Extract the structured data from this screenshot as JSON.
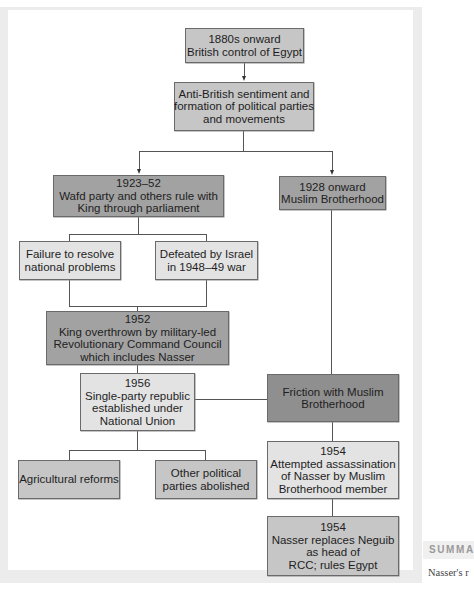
{
  "flowchart": {
    "nodes": {
      "british_control": {
        "lines": [
          "1880s onward",
          "British control of Egypt"
        ]
      },
      "anti_british": {
        "lines": [
          "Anti-British sentiment and",
          "formation of political parties",
          "and movements"
        ]
      },
      "wafd_rule": {
        "lines": [
          "1923–52",
          "Wafd party and others rule with",
          "King through parliament"
        ]
      },
      "muslim_brotherhood": {
        "lines": [
          "1928 onward",
          "Muslim Brotherhood"
        ]
      },
      "failure_problems": {
        "lines": [
          "Failure to resolve",
          "national problems"
        ]
      },
      "defeated_israel": {
        "lines": [
          "Defeated by Israel",
          "in 1948–49 war"
        ]
      },
      "king_overthrown": {
        "lines": [
          "1952",
          "King overthrown by military-led",
          "Revolutionary Command Council",
          "which includes Nasser"
        ]
      },
      "single_party": {
        "lines": [
          "1956",
          "Single-party republic",
          "established under",
          "National Union"
        ]
      },
      "friction": {
        "lines": [
          "Friction with Muslim",
          "Brotherhood"
        ]
      },
      "agricultural": {
        "lines": [
          "Agricultural reforms"
        ]
      },
      "parties_abolished": {
        "lines": [
          "Other political",
          "parties abolished"
        ]
      },
      "assassination": {
        "lines": [
          "1954",
          "Attempted assassination",
          "of Nasser by Muslim",
          "Brotherhood member"
        ]
      },
      "nasser_replaces": {
        "lines": [
          "1954",
          "Nasser replaces Neguib",
          "as head of",
          "RCC; rules Egypt"
        ]
      }
    },
    "edges": [
      [
        "british_control",
        "anti_british"
      ],
      [
        "anti_british",
        "wafd_rule"
      ],
      [
        "anti_british",
        "muslim_brotherhood"
      ],
      [
        "wafd_rule",
        "failure_problems"
      ],
      [
        "wafd_rule",
        "defeated_israel"
      ],
      [
        "failure_problems",
        "king_overthrown"
      ],
      [
        "defeated_israel",
        "king_overthrown"
      ],
      [
        "king_overthrown",
        "single_party"
      ],
      [
        "muslim_brotherhood",
        "friction"
      ],
      [
        "single_party",
        "friction"
      ],
      [
        "single_party",
        "agricultural"
      ],
      [
        "single_party",
        "parties_abolished"
      ],
      [
        "friction",
        "assassination"
      ],
      [
        "assassination",
        "nasser_replaces"
      ]
    ]
  },
  "sidebar": {
    "heading": "SUMMA",
    "text": "Nasser's r"
  },
  "colors": {
    "light": "#e3e3e3",
    "mid": "#c6c6c6",
    "dark": "#a2a2a2",
    "darker": "#8f8f8f"
  }
}
